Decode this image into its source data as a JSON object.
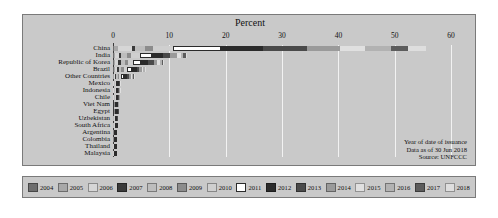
{
  "axis_title": "Percent",
  "note_lines": [
    "Year of date of issuance",
    "Data as of 30 Jun 2018",
    "Source: UNFCCC"
  ],
  "colors": {
    "panel_bg": "#c9c9c9",
    "grid": "#f2f2f2",
    "axis": "#3a3a3a",
    "text": "#111111"
  },
  "chart_data": {
    "type": "bar",
    "orientation": "horizontal",
    "stacked": true,
    "title": "",
    "xlabel": "Percent",
    "ylabel": "",
    "xlim": [
      0,
      63
    ],
    "xticks": [
      0,
      10,
      20,
      30,
      40,
      50,
      60
    ],
    "grid": true,
    "legend_position": "bottom",
    "annotations": [
      "Year of date of issuance",
      "Data as of 30 Jun 2018",
      "Source: UNFCCC"
    ],
    "series": [
      {
        "name": "2004",
        "color": "#6e6e6e"
      },
      {
        "name": "2005",
        "color": "#a8a8a8"
      },
      {
        "name": "2006",
        "color": "#d6d6d6"
      },
      {
        "name": "2007",
        "color": "#3a3a3a"
      },
      {
        "name": "2008",
        "color": "#bdbdbd"
      },
      {
        "name": "2009",
        "color": "#8c8c8c"
      },
      {
        "name": "2010",
        "color": "#cfcfcf"
      },
      {
        "name": "2011",
        "color": "#ffffff"
      },
      {
        "name": "2012",
        "color": "#2b2b2b"
      },
      {
        "name": "2013",
        "color": "#4a4a4a"
      },
      {
        "name": "2014",
        "color": "#9a9a9a"
      },
      {
        "name": "2015",
        "color": "#e0e0e0"
      },
      {
        "name": "2016",
        "color": "#b2b2b2"
      },
      {
        "name": "2017",
        "color": "#5c5c5c"
      },
      {
        "name": "2018",
        "color": "#dedede"
      }
    ],
    "categories": [
      "China",
      "India",
      "Republic of Korea",
      "Brazil",
      "Other Countries",
      "Mexico",
      "Indonesia",
      "Chile",
      "Viet Nam",
      "Egypt",
      "Uzbekistan",
      "South Africa",
      "Argentina",
      "Colombia",
      "Thailand",
      "Malaysia"
    ],
    "values": {
      "China": [
        0.2,
        0.6,
        2.6,
        0.5,
        1.8,
        1.4,
        3.5,
        8.6,
        7.5,
        7.7,
        5.9,
        4.5,
        4.5,
        3.1,
        3.1
      ],
      "India": [
        0.1,
        0.3,
        0.7,
        0.4,
        0.9,
        0.8,
        1.6,
        2.1,
        1.9,
        1.4,
        1.1,
        0.7,
        0.5,
        0.4,
        0.3
      ],
      "Republic of Korea": [
        0.1,
        0.2,
        0.5,
        0.6,
        0.7,
        0.5,
        1.0,
        1.3,
        1.4,
        0.9,
        0.7,
        0.5,
        0.3,
        0.2,
        0.2
      ],
      "Brazil": [
        0.1,
        0.2,
        0.4,
        0.3,
        0.5,
        0.4,
        0.6,
        0.9,
        0.8,
        0.5,
        0.4,
        0.3,
        0.2,
        0.1,
        0.1
      ],
      "Other Countries": [
        0.0,
        0.1,
        0.2,
        0.2,
        0.3,
        0.3,
        0.4,
        0.5,
        0.5,
        0.4,
        0.3,
        0.2,
        0.2,
        0.1,
        0.1
      ],
      "Mexico": [
        0.0,
        0.0,
        0.1,
        0.1,
        0.1,
        0.1,
        0.1,
        0.2,
        0.2,
        0.1,
        0.1,
        0.1,
        0.0,
        0.0,
        0.0
      ],
      "Indonesia": [
        0.0,
        0.0,
        0.1,
        0.1,
        0.1,
        0.1,
        0.1,
        0.1,
        0.1,
        0.1,
        0.1,
        0.1,
        0.0,
        0.0,
        0.0
      ],
      "Chile": [
        0.0,
        0.0,
        0.1,
        0.1,
        0.1,
        0.1,
        0.1,
        0.1,
        0.1,
        0.1,
        0.1,
        0.0,
        0.0,
        0.0,
        0.0
      ],
      "Viet Nam": [
        0.0,
        0.0,
        0.0,
        0.1,
        0.1,
        0.1,
        0.1,
        0.1,
        0.1,
        0.1,
        0.1,
        0.0,
        0.0,
        0.0,
        0.0
      ],
      "Egypt": [
        0.0,
        0.0,
        0.0,
        0.1,
        0.1,
        0.1,
        0.1,
        0.1,
        0.1,
        0.1,
        0.0,
        0.0,
        0.0,
        0.0,
        0.0
      ],
      "Uzbekistan": [
        0.0,
        0.0,
        0.0,
        0.0,
        0.1,
        0.1,
        0.1,
        0.1,
        0.1,
        0.1,
        0.0,
        0.0,
        0.0,
        0.0,
        0.0
      ],
      "South Africa": [
        0.0,
        0.0,
        0.0,
        0.0,
        0.1,
        0.1,
        0.1,
        0.1,
        0.1,
        0.0,
        0.0,
        0.0,
        0.0,
        0.0,
        0.0
      ],
      "Argentina": [
        0.0,
        0.0,
        0.0,
        0.0,
        0.0,
        0.1,
        0.1,
        0.1,
        0.1,
        0.0,
        0.0,
        0.0,
        0.0,
        0.0,
        0.0
      ],
      "Colombia": [
        0.0,
        0.0,
        0.0,
        0.0,
        0.0,
        0.1,
        0.1,
        0.1,
        0.1,
        0.0,
        0.0,
        0.0,
        0.0,
        0.0,
        0.0
      ],
      "Thailand": [
        0.0,
        0.0,
        0.0,
        0.0,
        0.0,
        0.0,
        0.1,
        0.1,
        0.1,
        0.0,
        0.0,
        0.0,
        0.0,
        0.0,
        0.0
      ],
      "Malaysia": [
        0.0,
        0.0,
        0.0,
        0.0,
        0.0,
        0.0,
        0.1,
        0.1,
        0.1,
        0.0,
        0.0,
        0.0,
        0.0,
        0.0,
        0.0
      ]
    },
    "totals": {
      "China": 55.5,
      "India": 13.2,
      "Republic of Korea": 9.1,
      "Brazil": 5.8,
      "Other Countries": 3.8,
      "Mexico": 1.2,
      "Indonesia": 1.0,
      "Chile": 0.9,
      "Viet Nam": 0.8,
      "Egypt": 0.7,
      "Uzbekistan": 0.7,
      "South Africa": 0.6,
      "Argentina": 0.5,
      "Colombia": 0.5,
      "Thailand": 0.4,
      "Malaysia": 0.4
    }
  }
}
